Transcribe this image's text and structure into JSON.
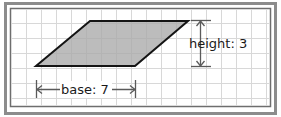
{
  "figure": {
    "name": "parallelogram-area-diagram",
    "type": "geometry-diagram",
    "shape": "parallelogram",
    "background_color": "#ffffff",
    "frame": {
      "outer_border_color": "#8c8c8c",
      "inner_border_color": "#6e6e6e",
      "inner_fill_color": "#ffffff"
    },
    "grid": {
      "visible": true,
      "cell_size_px": 15,
      "line_color": "#d8d8d8"
    },
    "shape_style": {
      "fill_color": "#a9a9a9",
      "stroke_color": "#141414",
      "stroke_width_px": 2,
      "vertices": [
        {
          "label": "top-left",
          "x": 90,
          "y": 21
        },
        {
          "label": "top-right",
          "x": 188,
          "y": 21
        },
        {
          "label": "bottom-right",
          "x": 135,
          "y": 66
        },
        {
          "label": "bottom-left",
          "x": 36,
          "y": 66
        }
      ]
    },
    "measurements": [
      {
        "id": "height",
        "label": "height: 3",
        "label_prefix": "height:",
        "value": "3",
        "orientation": "vertical",
        "arrow_style": "double-headed",
        "arrow_color": "#5a5a5a",
        "tick_color": "#5a5a5a",
        "x_px": 200,
        "y_start_px": 20,
        "y_end_px": 66,
        "text_x_px": 189,
        "text_y_px": 48
      },
      {
        "id": "base",
        "label": "base: 7",
        "label_prefix": "base:",
        "value": "7",
        "orientation": "horizontal",
        "arrow_style": "double-headed",
        "arrow_color": "#5a5a5a",
        "tick_color": "#5a5a5a",
        "y_px": 89,
        "x_start_px": 36,
        "x_end_px": 136,
        "text_x_px": 86,
        "text_y_px": 93
      }
    ]
  }
}
